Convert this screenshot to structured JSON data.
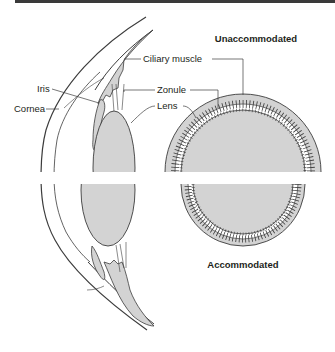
{
  "diagram": {
    "titles": {
      "unaccommodated": "Unaccommodated",
      "accommodated": "Accommodated"
    },
    "labels": {
      "ciliary_muscle": "Ciliary muscle",
      "zonule": "Zonule",
      "lens": "Lens",
      "iris": "Iris",
      "cornea": "Cornea"
    },
    "colors": {
      "tissue_fill": "#d3d3d3",
      "outline": "#3c3c3c",
      "top_bar": "#3a3a3a",
      "background": "#ffffff"
    }
  }
}
